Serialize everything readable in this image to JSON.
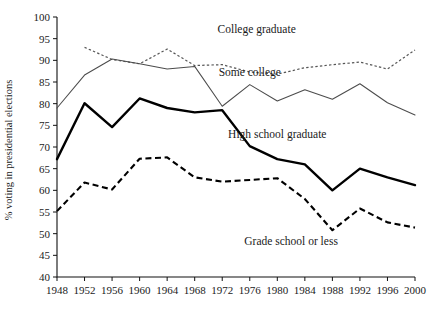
{
  "chart_data": {
    "type": "line",
    "title": "",
    "subtitle": "",
    "xlabel": "",
    "ylabel": "% voting in presidential elections",
    "xlim": [
      1948,
      2000
    ],
    "ylim": [
      40,
      100
    ],
    "ytick_step": 5,
    "grid": false,
    "legend_position": "inline-annotations",
    "x": [
      1948,
      1952,
      1956,
      1960,
      1964,
      1968,
      1972,
      1976,
      1980,
      1984,
      1988,
      1992,
      1996,
      2000
    ],
    "xtick_labels": [
      "1948",
      "1952",
      "1956",
      "1960",
      "1964",
      "1968",
      "1972",
      "1976",
      "1980",
      "1984",
      "1988",
      "1992",
      "1996",
      "2000"
    ],
    "ytick_labels": [
      "40",
      "45",
      "50",
      "55",
      "60",
      "65",
      "70",
      "75",
      "80",
      "85",
      "90",
      "95",
      "100"
    ],
    "ytick_values": [
      40,
      45,
      50,
      55,
      60,
      65,
      70,
      75,
      80,
      85,
      90,
      95,
      100
    ],
    "series": [
      {
        "name": "College graduate",
        "style": "dotted",
        "color": "#555555",
        "label_x": 1977,
        "label_y": 96.3,
        "x": [
          1952,
          1956,
          1960,
          1964,
          1968,
          1972,
          1976,
          1980,
          1984,
          1988,
          1992,
          1996,
          2000
        ],
        "values": [
          93.0,
          90.2,
          89.2,
          92.6,
          88.8,
          89.0,
          87.3,
          86.8,
          88.3,
          89.0,
          89.6,
          88.0,
          92.4
        ]
      },
      {
        "name": "Some college",
        "style": "solid-thin",
        "color": "#4c4c4c",
        "label_x": 1976,
        "label_y": 86.5,
        "x": [
          1948,
          1952,
          1956,
          1960,
          1964,
          1968,
          1972,
          1976,
          1980,
          1984,
          1988,
          1992,
          1996,
          2000
        ],
        "values": [
          79.0,
          86.6,
          90.3,
          89.2,
          88.0,
          88.6,
          79.4,
          84.4,
          80.6,
          83.2,
          81.0,
          84.6,
          80.2,
          77.4
        ]
      },
      {
        "name": "High school graduate",
        "style": "solid-thick",
        "color": "#000000",
        "label_x": 1980,
        "label_y": 72.0,
        "x": [
          1948,
          1952,
          1956,
          1960,
          1964,
          1968,
          1972,
          1976,
          1980,
          1984,
          1988,
          1992,
          1996,
          2000
        ],
        "values": [
          67.2,
          80.1,
          74.6,
          81.2,
          79.0,
          78.0,
          78.5,
          70.2,
          67.2,
          66.0,
          60.0,
          65.0,
          63.0,
          61.2
        ]
      },
      {
        "name": "Grade school or less",
        "style": "dashed-thick",
        "color": "#000000",
        "label_x": 1982,
        "label_y": 47.3,
        "x": [
          1948,
          1952,
          1956,
          1960,
          1964,
          1968,
          1972,
          1976,
          1980,
          1984,
          1988,
          1992,
          1996,
          2000
        ],
        "values": [
          55.2,
          61.8,
          60.2,
          67.3,
          67.6,
          63.0,
          62.0,
          62.4,
          62.8,
          58.0,
          50.8,
          55.8,
          52.6,
          51.4
        ]
      }
    ]
  }
}
